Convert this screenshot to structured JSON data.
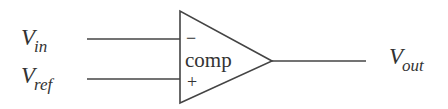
{
  "diagram": {
    "type": "comparator-schematic",
    "block": {
      "label": "comp",
      "shape": "triangle",
      "inverting_sign": "−",
      "noninverting_sign": "+"
    },
    "inputs": [
      {
        "name": "V",
        "sub": "in",
        "terminal": "−"
      },
      {
        "name": "V",
        "sub": "ref",
        "terminal": "+"
      }
    ],
    "output": {
      "name": "V",
      "sub": "out"
    },
    "colors": {
      "stroke": "#444444",
      "text": "#333333",
      "background": "#ffffff"
    }
  }
}
